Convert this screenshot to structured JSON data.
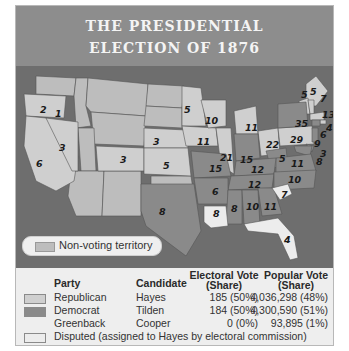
{
  "title": {
    "line1": "THE PRESIDENTIAL",
    "line2": "ELECTION OF 1876"
  },
  "colors": {
    "republican": "#cfcfcf",
    "democrat": "#8a8a8a",
    "disputed": "#ececec",
    "non_voting": "#bdbdbd",
    "water": "#6e6e6e",
    "title_bg": "#8d8d8d"
  },
  "map": {
    "legend_non_voting": "Non-voting territory",
    "state_votes": [
      {
        "label": "2",
        "x": 24,
        "y": 44
      },
      {
        "label": "1",
        "x": 43,
        "y": 47
      },
      {
        "label": "6",
        "x": 21,
        "y": 97
      },
      {
        "label": "3",
        "x": 43,
        "y": 80
      },
      {
        "label": "3",
        "x": 106,
        "y": 93
      },
      {
        "label": "3",
        "x": 137,
        "y": 75
      },
      {
        "label": "5",
        "x": 146,
        "y": 99
      },
      {
        "label": "5",
        "x": 168,
        "y": 43
      },
      {
        "label": "10",
        "x": 188,
        "y": 55
      },
      {
        "label": "11",
        "x": 186,
        "y": 75
      },
      {
        "label": "21",
        "x": 210,
        "y": 91
      },
      {
        "label": "15",
        "x": 230,
        "y": 93
      },
      {
        "label": "11",
        "x": 229,
        "y": 61
      },
      {
        "label": "22",
        "x": 253,
        "y": 78
      },
      {
        "label": "29",
        "x": 276,
        "y": 74
      },
      {
        "label": "35",
        "x": 284,
        "y": 57
      },
      {
        "label": "5",
        "x": 263,
        "y": 92
      },
      {
        "label": "11",
        "x": 277,
        "y": 97
      },
      {
        "label": "12",
        "x": 235,
        "y": 103
      },
      {
        "label": "12",
        "x": 233,
        "y": 118
      },
      {
        "label": "10",
        "x": 276,
        "y": 113
      },
      {
        "label": "15",
        "x": 193,
        "y": 102
      },
      {
        "label": "6",
        "x": 198,
        "y": 125
      },
      {
        "label": "8",
        "x": 216,
        "y": 141
      },
      {
        "label": "10",
        "x": 233,
        "y": 138
      },
      {
        "label": "11",
        "x": 251,
        "y": 138
      },
      {
        "label": "7",
        "x": 267,
        "y": 128
      },
      {
        "label": "8",
        "x": 197,
        "y": 145
      },
      {
        "label": "8",
        "x": 143,
        "y": 141
      },
      {
        "label": "4",
        "x": 269,
        "y": 172
      },
      {
        "label": "5",
        "x": 288,
        "y": 29
      },
      {
        "label": "5",
        "x": 297,
        "y": 26
      },
      {
        "label": "7",
        "x": 307,
        "y": 31
      },
      {
        "label": "13",
        "x": 310,
        "y": 48
      },
      {
        "label": "4",
        "x": 314,
        "y": 61
      },
      {
        "label": "6",
        "x": 308,
        "y": 67
      },
      {
        "label": "9",
        "x": 302,
        "y": 76
      },
      {
        "label": "3",
        "x": 308,
        "y": 86
      },
      {
        "label": "8",
        "x": 304,
        "y": 94
      }
    ]
  },
  "table": {
    "headers": {
      "party": "Party",
      "candidate": "Candidate",
      "electoral_line1": "Electoral Vote",
      "electoral_line2": "(Share)",
      "popular_line1": "Popular Vote",
      "popular_line2": "(Share)"
    },
    "rows": [
      {
        "party": "Republican",
        "candidate": "Hayes",
        "electoral": "185 (50%)",
        "popular": "4,036,298 (48%)",
        "swatch": "republican"
      },
      {
        "party": "Democrat",
        "candidate": "Tilden",
        "electoral": "184 (50%)",
        "popular": "4,300,590 (51%)",
        "swatch": "democrat"
      },
      {
        "party": "Greenback",
        "candidate": "Cooper",
        "electoral": "0 (0%)",
        "popular": "93,895 (1%)",
        "swatch": "none"
      }
    ],
    "disputed_note": "Disputed (assigned to Hayes by electoral commission)"
  }
}
